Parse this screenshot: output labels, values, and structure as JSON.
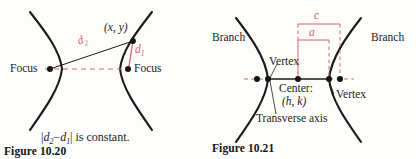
{
  "page": {
    "background": "#fdfdfb",
    "ink": "#1c1c1c",
    "accent": "#d4607a",
    "width": 416,
    "height": 159
  },
  "figures": [
    {
      "id": "figure-10-20",
      "caption": "Figure 10.20",
      "subject": "hyperbola-definition",
      "statement": {
        "d2": "d",
        "d2_sub": "2",
        "d1": "d",
        "d1_sub": "1",
        "minus": "−",
        "bar_open": "|",
        "bar_close": "|",
        "tail": "is  constant."
      },
      "labels": {
        "focus_left": "Focus",
        "focus_right": "Focus",
        "point": "(x, y)",
        "d2": "d",
        "d2_sub": "2",
        "d1": "d",
        "d1_sub": "1"
      },
      "geometry": {
        "focus_left_xy": [
          50,
          69
        ],
        "focus_right_xy": [
          128,
          69
        ],
        "point_xy": [
          133,
          41
        ],
        "vertex_left_x": 62,
        "vertex_right_x": 120
      }
    },
    {
      "id": "figure-10-21",
      "caption": "Figure 10.21",
      "subject": "hyperbola-parts",
      "labels": {
        "branch_left": "Branch",
        "branch_right": "Branch",
        "vertex_left": "Vertex",
        "vertex_right": "Vertex",
        "center": "Center:",
        "center_coords": "(h, k)",
        "transverse_axis": "Transverse axis",
        "measure_c": "c",
        "measure_a": "a"
      },
      "geometry": {
        "center_x": 298,
        "axis_y": 79,
        "focus_left_x": 257,
        "vertex_left_x": 268,
        "vertex_right_x": 329,
        "focus_right_x": 340
      }
    }
  ]
}
